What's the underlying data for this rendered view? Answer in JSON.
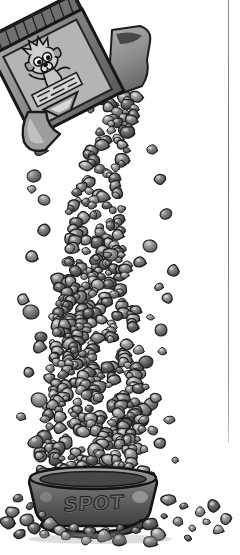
{
  "illustration": {
    "title": "Dog food box pouring kibble into a bowl",
    "style": "grayscale pen-and-ink cartoon with gray wash shading",
    "background_color": "#ffffff",
    "canvas": {
      "width": 240,
      "height": 555
    }
  },
  "border": {
    "name": "vertical-rule",
    "orientation": "vertical",
    "color": "#6f6f6f",
    "x": 228,
    "top": 0,
    "bottom": 443
  },
  "box": {
    "label": "dog-food-box",
    "description": "tilted open cereal-style carton pouring downward to the left",
    "rotation_deg": -28,
    "colors": {
      "body": "#7c7c7c",
      "dark_edge": "#2a2a2a",
      "panel": "#b9b9b9"
    },
    "front_panel": {
      "character": "cartoon dog mascot with large round eyes and spiky fur",
      "label_band": "illustrated food-bowl graphic with text lines"
    },
    "top_flap": {
      "name": "open-flap",
      "color": "#8f8f8f"
    },
    "ribbed_edge": {
      "name": "box-top-ribbing",
      "stripes": 9
    }
  },
  "stream": {
    "label": "kibble-stream",
    "description": "continuous falling column of kibble from box spout to bowl, widening toward the bottom",
    "segments": [
      {
        "name": "spout-burst",
        "y": 120,
        "width": 60
      },
      {
        "name": "upper-thin-fall",
        "y": 200,
        "width": 52
      },
      {
        "name": "mid-column",
        "y": 300,
        "width": 86
      },
      {
        "name": "lower-column",
        "y": 400,
        "width": 96
      },
      {
        "name": "pile-crown",
        "y": 470,
        "width": 118
      }
    ],
    "piece_colors": [
      "#9a9a9a",
      "#7b7b7b",
      "#636363",
      "#4d4d4d",
      "#b5b5b5"
    ],
    "outline_color": "#1f1f1f"
  },
  "bowl": {
    "label": "dog-bowl",
    "text": "SPOT",
    "shape": "wide low dish with flared rim and footed base",
    "colors": {
      "body": "#5e5e5e",
      "rim": "#8c8c8c",
      "outline": "#1a1a1a",
      "text": "#6b6b6b"
    },
    "position": {
      "x": 28,
      "y": 470,
      "width": 130,
      "height": 60
    }
  },
  "scatter": {
    "label": "scattered-kibble",
    "description": "loose kibble pieces strewn on the ground around the bowl and alongside the falling stream",
    "count": 46
  }
}
